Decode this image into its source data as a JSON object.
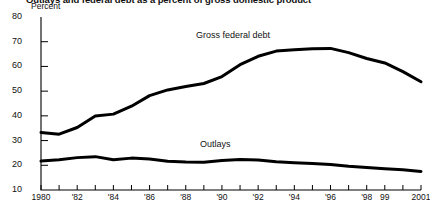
{
  "figure": {
    "title": "Outlays and federal debt as a percent of gross domestic product",
    "unit_label": "Percent"
  },
  "chart_data": {
    "type": "line",
    "title": "Outlays and federal debt as a percent of gross domestic product",
    "xlabel": "",
    "ylabel": "Percent",
    "xlim": [
      1980,
      2001
    ],
    "ylim": [
      10,
      80
    ],
    "yticks": [
      10,
      20,
      30,
      40,
      50,
      60,
      70,
      80
    ],
    "ytick_labels": [
      "10",
      "20",
      "30",
      "40",
      "50",
      "60",
      "70",
      "80"
    ],
    "xticks": [
      1980,
      1981,
      1982,
      1983,
      1984,
      1985,
      1986,
      1987,
      1988,
      1989,
      1990,
      1991,
      1992,
      1993,
      1994,
      1995,
      1996,
      1997,
      1998,
      1999,
      2000,
      2001
    ],
    "xtick_labels": [
      "1980",
      "",
      "'82",
      "",
      "'84",
      "",
      "'86",
      "",
      "'88",
      "",
      "'90",
      "",
      "'92",
      "",
      "'94",
      "",
      "'96",
      "",
      "'98",
      "99",
      "",
      "2001"
    ],
    "grid": false,
    "legend_position": "inline-annotation",
    "line_color": "#000000",
    "line_width": 3,
    "x": [
      1980,
      1981,
      1982,
      1983,
      1984,
      1985,
      1986,
      1987,
      1988,
      1989,
      1990,
      1991,
      1992,
      1993,
      1994,
      1995,
      1996,
      1997,
      1998,
      1999,
      2000,
      2001
    ],
    "series": [
      {
        "name": "Gross federal debt",
        "label_text": "Gross federal debt",
        "values": [
          33.3,
          32.6,
          35.3,
          39.9,
          40.7,
          43.9,
          48.2,
          50.5,
          51.9,
          53.1,
          55.9,
          60.7,
          64.1,
          66.2,
          66.7,
          67.2,
          67.3,
          65.6,
          63.2,
          61.4,
          57.9,
          53.8
        ]
      },
      {
        "name": "Outlays",
        "label_text": "Outlays",
        "values": [
          21.7,
          22.2,
          23.1,
          23.5,
          22.2,
          22.9,
          22.5,
          21.6,
          21.3,
          21.2,
          21.9,
          22.3,
          22.1,
          21.4,
          21.0,
          20.7,
          20.3,
          19.6,
          19.1,
          18.6,
          18.2,
          17.5
        ]
      }
    ]
  }
}
